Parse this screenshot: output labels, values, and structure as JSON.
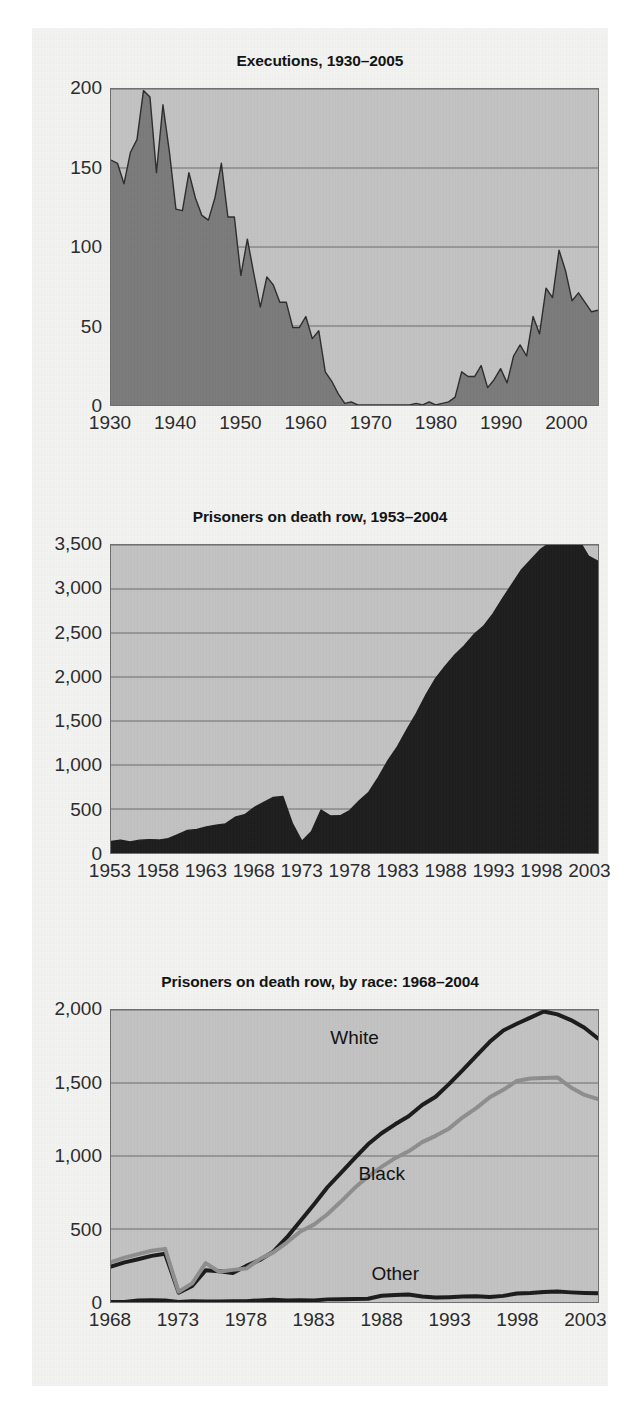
{
  "page": {
    "background": "#f3f3f1",
    "text_color": "#1a1a1a"
  },
  "colors": {
    "plot_background": "#c2c2c2",
    "plot_border": "#6e6e6e",
    "gridline": "#6b6b6b",
    "executions_fill": "#7a7a7a",
    "executions_stroke": "#2c2c2c",
    "deathrow_fill": "#1c1c1c",
    "series_white": "#1a1a1a",
    "series_black": "#8e8e8e",
    "series_other": "#1a1a1a"
  },
  "charts": [
    {
      "id": "executions",
      "title": "Executions, 1930–2005",
      "type": "area",
      "xlabel": "",
      "ylabel": "",
      "xlim": [
        1930,
        2005
      ],
      "ylim": [
        0,
        200
      ],
      "grid": true,
      "yticks": [
        "200",
        "150",
        "100",
        "50",
        "0"
      ],
      "ytick_values": [
        200,
        150,
        100,
        50,
        0
      ],
      "xticks": [
        "1930",
        "1940",
        "1950",
        "1960",
        "1970",
        "1980",
        "1990",
        "2000"
      ],
      "xtick_values": [
        1930,
        1940,
        1950,
        1960,
        1970,
        1980,
        1990,
        2000
      ],
      "series": [
        {
          "name": "Executions",
          "x": [
            1930,
            1931,
            1932,
            1933,
            1934,
            1935,
            1936,
            1937,
            1938,
            1939,
            1940,
            1941,
            1942,
            1943,
            1944,
            1945,
            1946,
            1947,
            1948,
            1949,
            1950,
            1951,
            1952,
            1953,
            1954,
            1955,
            1956,
            1957,
            1958,
            1959,
            1960,
            1961,
            1962,
            1963,
            1964,
            1965,
            1966,
            1967,
            1968,
            1969,
            1970,
            1971,
            1972,
            1973,
            1974,
            1975,
            1976,
            1977,
            1978,
            1979,
            1980,
            1981,
            1982,
            1983,
            1984,
            1985,
            1986,
            1987,
            1988,
            1989,
            1990,
            1991,
            1992,
            1993,
            1994,
            1995,
            1996,
            1997,
            1998,
            1999,
            2000,
            2001,
            2002,
            2003,
            2004,
            2005
          ],
          "values": [
            155,
            153,
            140,
            160,
            168,
            199,
            195,
            147,
            190,
            160,
            124,
            123,
            147,
            131,
            120,
            117,
            131,
            153,
            119,
            119,
            82,
            105,
            83,
            62,
            81,
            76,
            65,
            65,
            49,
            49,
            56,
            42,
            47,
            21,
            15,
            7,
            1,
            2,
            0,
            0,
            0,
            0,
            0,
            0,
            0,
            0,
            0,
            1,
            0,
            2,
            0,
            1,
            2,
            5,
            21,
            18,
            18,
            25,
            11,
            16,
            23,
            14,
            31,
            38,
            31,
            56,
            45,
            74,
            68,
            98,
            85,
            66,
            71,
            65,
            59,
            60
          ]
        }
      ]
    },
    {
      "id": "death-row-total",
      "title": "Prisoners on death row, 1953–2004",
      "type": "area",
      "xlabel": "",
      "ylabel": "",
      "xlim": [
        1953,
        2004
      ],
      "ylim": [
        0,
        3500
      ],
      "grid": true,
      "yticks": [
        "3,500",
        "3,000",
        "2,500",
        "2,000",
        "1,500",
        "1,000",
        "500",
        "0"
      ],
      "ytick_values": [
        3500,
        3000,
        2500,
        2000,
        1500,
        1000,
        500,
        0
      ],
      "xticks": [
        "1953",
        "1958",
        "1963",
        "1968",
        "1973",
        "1978",
        "1983",
        "1988",
        "1993",
        "1998",
        "2003"
      ],
      "xtick_values": [
        1953,
        1958,
        1963,
        1968,
        1973,
        1978,
        1983,
        1988,
        1993,
        1998,
        2003
      ],
      "series": [
        {
          "name": "Prisoners on death row",
          "x": [
            1953,
            1954,
            1955,
            1956,
            1957,
            1958,
            1959,
            1960,
            1961,
            1962,
            1963,
            1964,
            1965,
            1966,
            1967,
            1968,
            1969,
            1970,
            1971,
            1972,
            1973,
            1974,
            1975,
            1976,
            1977,
            1978,
            1979,
            1980,
            1981,
            1982,
            1983,
            1984,
            1985,
            1986,
            1987,
            1988,
            1989,
            1990,
            1991,
            1992,
            1993,
            1994,
            1995,
            1996,
            1997,
            1998,
            1999,
            2000,
            2001,
            2002,
            2003,
            2004
          ],
          "values": [
            131,
            147,
            125,
            146,
            151,
            147,
            164,
            210,
            257,
            267,
            297,
            315,
            331,
            406,
            435,
            517,
            575,
            631,
            642,
            334,
            134,
            244,
            488,
            420,
            423,
            482,
            593,
            691,
            860,
            1050,
            1209,
            1405,
            1591,
            1800,
            1984,
            2124,
            2250,
            2356,
            2482,
            2575,
            2716,
            2890,
            3054,
            3219,
            3335,
            3452,
            3527,
            3593,
            3581,
            3557,
            3374,
            3314
          ]
        }
      ]
    },
    {
      "id": "death-row-by-race",
      "title": "Prisoners on death row, by race: 1968–2004",
      "type": "line",
      "xlabel": "",
      "ylabel": "",
      "xlim": [
        1968,
        2004
      ],
      "ylim": [
        0,
        2000
      ],
      "grid": true,
      "yticks": [
        "2,000",
        "1,500",
        "1,000",
        "500",
        "0"
      ],
      "ytick_values": [
        2000,
        1500,
        1000,
        500,
        0
      ],
      "xticks": [
        "1968",
        "1973",
        "1978",
        "1983",
        "1988",
        "1993",
        "1998",
        "2003"
      ],
      "xtick_values": [
        1968,
        1973,
        1978,
        1983,
        1988,
        1993,
        1998,
        2003
      ],
      "annotations": [
        {
          "text": "White",
          "x": 1986,
          "y": 1800
        },
        {
          "text": "Black",
          "x": 1988,
          "y": 880
        },
        {
          "text": "Other",
          "x": 1989,
          "y": 200
        }
      ],
      "series": [
        {
          "name": "White",
          "color": "#1a1a1a",
          "x": [
            1968,
            1969,
            1970,
            1971,
            1972,
            1973,
            1974,
            1975,
            1976,
            1977,
            1978,
            1979,
            1980,
            1981,
            1982,
            1983,
            1984,
            1985,
            1986,
            1987,
            1988,
            1989,
            1990,
            1991,
            1992,
            1993,
            1994,
            1995,
            1996,
            1997,
            1998,
            1999,
            2000,
            2001,
            2002,
            2003,
            2004
          ],
          "values": [
            243,
            271,
            293,
            316,
            330,
            64,
            110,
            218,
            210,
            198,
            247,
            288,
            345,
            442,
            555,
            668,
            786,
            884,
            984,
            1080,
            1156,
            1217,
            1272,
            1349,
            1406,
            1494,
            1588,
            1686,
            1782,
            1860,
            1906,
            1948,
            1990,
            1970,
            1931,
            1878,
            1805
          ]
        },
        {
          "name": "Black",
          "color": "#8e8e8e",
          "x": [
            1968,
            1969,
            1970,
            1971,
            1972,
            1973,
            1974,
            1975,
            1976,
            1977,
            1978,
            1979,
            1980,
            1981,
            1982,
            1983,
            1984,
            1985,
            1986,
            1987,
            1988,
            1989,
            1990,
            1991,
            1992,
            1993,
            1994,
            1995,
            1996,
            1997,
            1998,
            1999,
            2000,
            2001,
            2002,
            2003,
            2004
          ],
          "values": [
            274,
            304,
            328,
            351,
            364,
            70,
            128,
            266,
            207,
            220,
            229,
            294,
            340,
            407,
            483,
            530,
            601,
            688,
            780,
            860,
            925,
            985,
            1032,
            1095,
            1138,
            1189,
            1265,
            1328,
            1402,
            1453,
            1514,
            1531,
            1535,
            1538,
            1469,
            1418,
            1390
          ]
        },
        {
          "name": "Other",
          "color": "#1a1a1a",
          "x": [
            1968,
            1969,
            1970,
            1971,
            1972,
            1973,
            1974,
            1975,
            1976,
            1977,
            1978,
            1979,
            1980,
            1981,
            1982,
            1983,
            1984,
            1985,
            1986,
            1987,
            1988,
            1989,
            1990,
            1991,
            1992,
            1993,
            1994,
            1995,
            1996,
            1997,
            1998,
            1999,
            2000,
            2001,
            2002,
            2003,
            2004
          ],
          "values": [
            0,
            0,
            10,
            12,
            10,
            0,
            6,
            4,
            3,
            5,
            6,
            11,
            16,
            11,
            12,
            11,
            18,
            19,
            20,
            22,
            43,
            48,
            52,
            38,
            31,
            33,
            37,
            40,
            35,
            42,
            58,
            62,
            68,
            72,
            66,
            62,
            60
          ]
        }
      ]
    }
  ]
}
